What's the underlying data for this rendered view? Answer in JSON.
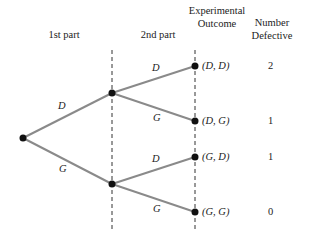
{
  "headers": {
    "first_part": "1st part",
    "second_part": "2nd part",
    "outcome_line1": "Experimental",
    "outcome_line2": "Outcome",
    "defective_line1": "Number",
    "defective_line2": "Defective"
  },
  "branches": {
    "first": [
      {
        "label": "D"
      },
      {
        "label": "G"
      }
    ],
    "second": [
      {
        "label": "D"
      },
      {
        "label": "G"
      },
      {
        "label": "D"
      },
      {
        "label": "G"
      }
    ]
  },
  "outcomes": [
    {
      "outcome": "(D, D)",
      "defective": "2"
    },
    {
      "outcome": "(D, G)",
      "defective": "1"
    },
    {
      "outcome": "(G, D)",
      "defective": "1"
    },
    {
      "outcome": "(G, G)",
      "defective": "0"
    }
  ],
  "colors": {
    "branch": "#8a8a8a",
    "node": "#111111",
    "dash": "#333333"
  }
}
